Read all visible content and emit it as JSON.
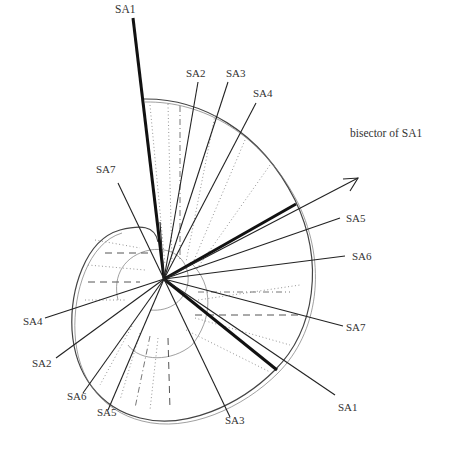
{
  "diagram": {
    "center": {
      "x": 164,
      "y": 279
    },
    "labels": {
      "sa1_top": "SA1",
      "sa2_top": "SA2",
      "sa3_top": "SA3",
      "sa4_top": "SA4",
      "bisector": "bisector of SA1",
      "sa5_right": "SA5",
      "sa6_right": "SA6",
      "sa7_right": "SA7",
      "sa1_bottom": "SA1",
      "sa3_bottom": "SA3",
      "sa5_bottom": "SA5",
      "sa6_bottom": "SA6",
      "sa2_left": "SA2",
      "sa4_left": "SA4",
      "sa7_topleft": "SA7"
    },
    "rays": [
      {
        "name": "SA1",
        "end": [
          133,
          18
        ],
        "weight": "thick"
      },
      {
        "name": "SA2",
        "end": [
          198,
          82
        ],
        "weight": "thin"
      },
      {
        "name": "SA3",
        "end": [
          228,
          82
        ],
        "weight": "thin"
      },
      {
        "name": "SA4",
        "end": [
          256,
          103
        ],
        "weight": "thin"
      },
      {
        "name": "bisector of SA1",
        "end": [
          358,
          178
        ],
        "weight": "thin",
        "arrow": true
      },
      {
        "name": "SA5",
        "end": [
          340,
          218
        ],
        "weight": "thin"
      },
      {
        "name": "SA6",
        "end": [
          345,
          256
        ],
        "weight": "thin"
      },
      {
        "name": "SA7",
        "end": [
          343,
          326
        ],
        "weight": "thin"
      },
      {
        "name": "SA1",
        "end": [
          335,
          395
        ],
        "weight": "thick"
      },
      {
        "name": "SA3",
        "end": [
          230,
          417
        ],
        "weight": "thin"
      },
      {
        "name": "SA5",
        "end": [
          108,
          410
        ],
        "weight": "thin"
      },
      {
        "name": "SA6",
        "end": [
          83,
          393
        ],
        "weight": "thin"
      },
      {
        "name": "SA2",
        "end": [
          56,
          358
        ],
        "weight": "thin"
      },
      {
        "name": "SA4",
        "end": [
          45,
          318
        ],
        "weight": "thin"
      },
      {
        "name": "SA7",
        "end": [
          118,
          183
        ],
        "weight": "thin"
      }
    ],
    "colors": {
      "ink": "#222222",
      "background": "#ffffff"
    }
  }
}
